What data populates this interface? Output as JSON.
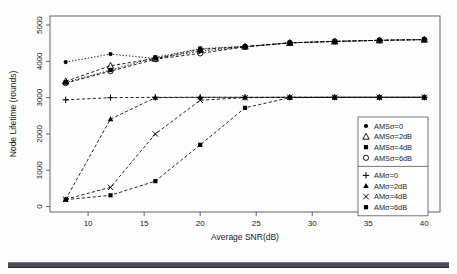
{
  "figure": {
    "background_color": "#fdfdfd",
    "frame_color": "#555555",
    "bottom_rule_color": "#4a4a52"
  },
  "chart_data": {
    "type": "line",
    "title": "",
    "subtitle": "",
    "xlabel": "Average SNR(dB)",
    "ylabel": "Node Lifetime (rounds)",
    "xlim": [
      6.6,
      41.4
    ],
    "ylim": [
      -150,
      5250
    ],
    "xticks": [
      10,
      15,
      20,
      25,
      30,
      35,
      40
    ],
    "xticklabels": [
      "10",
      "15",
      "20",
      "25",
      "30",
      "35",
      "40"
    ],
    "yticks": [
      0,
      1000,
      2000,
      3000,
      4000,
      5000
    ],
    "yticklabels": [
      "0",
      "1000",
      "2000",
      "3000",
      "4000",
      "5000"
    ],
    "grid": false,
    "x": [
      8,
      12,
      16,
      20,
      24,
      28,
      32,
      36,
      40
    ],
    "legend_position": "right-inside-lower",
    "series": [
      {
        "name": "AMSσ=0",
        "marker": "filled-circle",
        "linestyle": "dotted",
        "color": "#000000",
        "values": [
          3980,
          4200,
          4080,
          4280,
          4400,
          4510,
          4550,
          4580,
          4600
        ]
      },
      {
        "name": "AMSσ=2dB",
        "marker": "open-triangle",
        "linestyle": "dashed",
        "color": "#000000",
        "values": [
          3450,
          3880,
          4080,
          4330,
          4410,
          4510,
          4550,
          4580,
          4600
        ]
      },
      {
        "name": "AMSσ=4dB",
        "marker": "filled-square",
        "linestyle": "dotted",
        "color": "#000000",
        "values": [
          3420,
          3760,
          4110,
          4350,
          4410,
          4510,
          4550,
          4580,
          4600
        ]
      },
      {
        "name": "AMSσ=6dB",
        "marker": "open-circle",
        "linestyle": "dashed",
        "color": "#000000",
        "values": [
          3400,
          3730,
          4060,
          4220,
          4400,
          4510,
          4550,
          4580,
          4600
        ]
      },
      {
        "name": "AMσ=0",
        "marker": "plus",
        "linestyle": "dashed",
        "color": "#000000",
        "values": [
          2940,
          3000,
          3010,
          3010,
          3010,
          3010,
          3010,
          3010,
          3010
        ]
      },
      {
        "name": "AMσ=2dB",
        "marker": "filled-triangle",
        "linestyle": "dashed",
        "color": "#000000",
        "values": [
          200,
          2410,
          3000,
          3010,
          3010,
          3010,
          3010,
          3010,
          3010
        ]
      },
      {
        "name": "AMσ=4dB",
        "marker": "cross",
        "linestyle": "dashed",
        "color": "#000000",
        "values": [
          200,
          530,
          2000,
          2930,
          3000,
          3010,
          3010,
          3010,
          3010
        ]
      },
      {
        "name": "AMσ=6dB",
        "marker": "filled-square",
        "linestyle": "dashed",
        "color": "#000000",
        "values": [
          190,
          310,
          700,
          1700,
          2720,
          3000,
          3010,
          3010,
          3010
        ]
      }
    ]
  },
  "legend": {
    "group_1": [
      {
        "label": "AMSσ=0",
        "marker": "filled-circle"
      },
      {
        "label": "AMSσ=2dB",
        "marker": "open-triangle"
      },
      {
        "label": "AMSσ=4dB",
        "marker": "filled-square"
      },
      {
        "label": "AMSσ=6dB",
        "marker": "open-circle"
      }
    ],
    "group_2": [
      {
        "label": "AMσ=0",
        "marker": "plus"
      },
      {
        "label": "AMσ=2dB",
        "marker": "filled-triangle"
      },
      {
        "label": "AMσ=4dB",
        "marker": "cross"
      },
      {
        "label": "AMσ=6dB",
        "marker": "filled-square"
      }
    ]
  }
}
